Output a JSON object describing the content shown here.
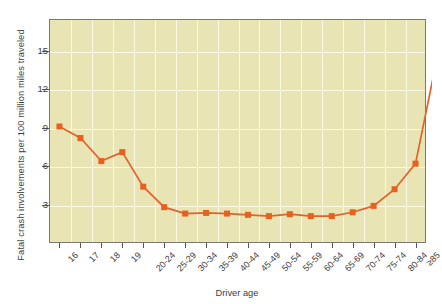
{
  "chart_data": {
    "type": "line",
    "title": "",
    "xlabel": "Driver age",
    "ylabel": "Fatal crash involvements per 100 million miles traveled",
    "categories": [
      "16",
      "17",
      "18",
      "19",
      "20-24",
      "25-29",
      "30-34",
      "35-39",
      "40-44",
      "45-49",
      "50-54",
      "55-59",
      "60-64",
      "65-69",
      "70-74",
      "75-74",
      "80-84",
      "≥85"
    ],
    "values": [
      9.1,
      8.2,
      6.4,
      7.1,
      4.4,
      2.8,
      2.3,
      2.35,
      2.3,
      2.2,
      2.1,
      2.25,
      2.1,
      2.1,
      2.4,
      2.9,
      4.2,
      6.2
    ],
    "series": [
      {
        "name": "Fatal crash involvement rate",
        "values": [
          9.1,
          8.2,
          6.4,
          7.1,
          4.4,
          2.8,
          2.3,
          2.35,
          2.3,
          2.2,
          2.1,
          2.25,
          2.1,
          2.1,
          2.4,
          2.9,
          4.2,
          6.2
        ]
      }
    ],
    "ylim": [
      0,
      17.5
    ],
    "yticks": [
      3,
      6,
      9,
      12,
      15
    ],
    "ytick_labels": [
      "3",
      "6",
      "9",
      "12",
      "15"
    ],
    "grid": true,
    "legend": "none",
    "marker": "square",
    "colors": {
      "plot_background": "#e9e4b3",
      "grid": "#fbf8e6",
      "line": "#e2622c",
      "marker": "#e8601f",
      "axis": "#55554e",
      "text": "#3d3d3d",
      "page_background": "#ffffff"
    },
    "note": "Last category value at ≥85 rises sharply to 14.2"
  },
  "last_point_value": 14.2
}
